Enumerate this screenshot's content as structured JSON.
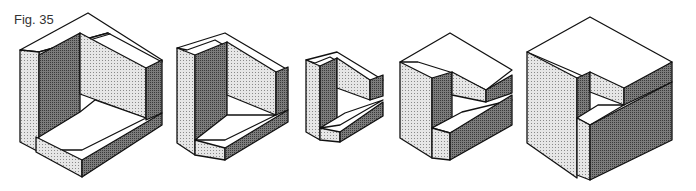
{
  "caption": "Fig. 35",
  "colors": {
    "top": "#ffffff",
    "light": "#d6d6d6",
    "mid": "#a8a8a8",
    "dark": "#6e6e6e",
    "stroke": "#111111"
  },
  "figures": [
    {
      "name": "figure-1-full-corner",
      "polys": [
        {
          "f": "top",
          "p": "88,13 162,60 162,62 108,33 39,52 20,50"
        },
        {
          "f": "top",
          "p": "39,52 108,33 110,34 39,55"
        },
        {
          "f": "light",
          "p": "20,50 39,52 39,152 20,142"
        },
        {
          "f": "dark",
          "p": "39,55 80,33 80,124 39,150"
        },
        {
          "f": "light",
          "p": "80,33 146,68 146,118 80,94"
        },
        {
          "f": "dark",
          "p": "146,68 162,60 162,113 146,120"
        },
        {
          "f": "top",
          "p": "39,137 80,112 95,100 146,118 82,150 39,150"
        },
        {
          "f": "light",
          "p": "36,137 82,160 82,177 36,152"
        },
        {
          "f": "dark",
          "p": "82,160 162,113 162,125 82,177"
        }
      ]
    },
    {
      "name": "figure-2",
      "polys": [
        {
          "f": "top",
          "p": "225,33 288,70 276,75 215,40 187,50 177,48"
        },
        {
          "f": "light",
          "p": "177,48 195,55 195,155 177,143"
        },
        {
          "f": "dark",
          "p": "195,55 227,42 227,127 195,140"
        },
        {
          "f": "light",
          "p": "227,42 276,72 276,115 227,95"
        },
        {
          "f": "dark",
          "p": "276,72 288,67 288,110 276,115"
        },
        {
          "f": "top",
          "p": "195,140 227,115 276,115 225,140"
        },
        {
          "f": "light",
          "p": "195,140 225,148 225,160 195,155"
        },
        {
          "f": "dark",
          "p": "225,148 288,110 288,122 225,160"
        }
      ]
    },
    {
      "name": "figure-3",
      "polys": [
        {
          "f": "top",
          "p": "337,52 383,80 376,84 330,57 315,63 306,60"
        },
        {
          "f": "light",
          "p": "306,60 320,66 320,140 306,132"
        },
        {
          "f": "dark",
          "p": "320,66 337,58 337,120 320,128"
        },
        {
          "f": "light",
          "p": "337,58 370,80 370,100 337,88"
        },
        {
          "f": "dark",
          "p": "370,80 383,75 383,96 370,100"
        },
        {
          "f": "top",
          "p": "320,128 345,113 383,100 340,125"
        },
        {
          "f": "light",
          "p": "320,128 340,132 340,142 320,140"
        },
        {
          "f": "dark",
          "p": "340,132 383,102 383,116 340,142"
        }
      ]
    },
    {
      "name": "figure-4",
      "polys": [
        {
          "f": "top",
          "p": "450,33 512,70 486,90 450,72 418,62 400,62"
        },
        {
          "f": "light",
          "p": "400,62 432,78 432,158 400,138"
        },
        {
          "f": "dark",
          "p": "432,78 452,72 452,118 432,128"
        },
        {
          "f": "light",
          "p": "452,72 486,90 486,102 452,95"
        },
        {
          "f": "dark",
          "p": "486,90 512,75 512,93 486,102"
        },
        {
          "f": "top",
          "p": "432,128 462,112 512,100 450,133"
        },
        {
          "f": "light",
          "p": "432,128 450,133 450,160 432,158"
        },
        {
          "f": "dark",
          "p": "450,133 512,95 512,125 450,160"
        }
      ]
    },
    {
      "name": "figure-5",
      "polys": [
        {
          "f": "top",
          "p": "590,17 672,62 624,95 596,82 569,70 527,52"
        },
        {
          "f": "light",
          "p": "527,52 577,78 577,178 527,143"
        },
        {
          "f": "dark",
          "p": "577,78 590,72 590,118 577,125"
        },
        {
          "f": "light",
          "p": "590,72 624,88 624,105 590,92"
        },
        {
          "f": "dark",
          "p": "624,88 672,62 672,82 624,105"
        },
        {
          "f": "top",
          "p": "577,118 598,105 624,105 590,125"
        },
        {
          "f": "light",
          "p": "577,118 590,125 590,180 577,175"
        },
        {
          "f": "dark",
          "p": "590,125 672,82 672,140 590,180"
        }
      ]
    }
  ]
}
